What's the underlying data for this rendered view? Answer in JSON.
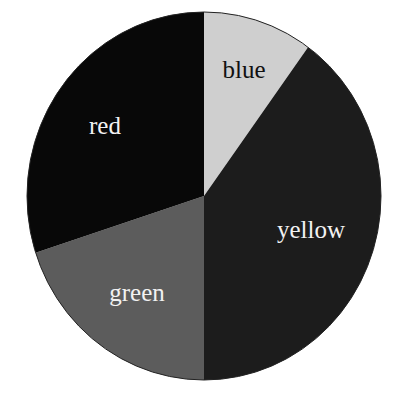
{
  "chart_data": {
    "type": "pie",
    "title": "",
    "categories": [
      "blue",
      "yellow",
      "green",
      "red"
    ],
    "values": [
      10,
      40,
      20,
      30
    ],
    "units": "percent (estimated from slice angles)",
    "start_angle_deg": 0,
    "direction": "clockwise from 12 o'clock",
    "legend": "none (labels drawn inside slices)",
    "slices": [
      {
        "label": "blue",
        "value": 10,
        "fill": "#cfcfcf",
        "text_color": "#111111",
        "label_pos": [
          244,
          72
        ]
      },
      {
        "label": "yellow",
        "value": 40,
        "fill": "#1c1c1c",
        "text_color": "#f2f2f2",
        "label_pos": [
          311,
          232
        ]
      },
      {
        "label": "green",
        "value": 20,
        "fill": "#5c5c5c",
        "text_color": "#f2f2f2",
        "label_pos": [
          137,
          295
        ]
      },
      {
        "label": "red",
        "value": 30,
        "fill": "#080808",
        "text_color": "#f2f2f2",
        "label_pos": [
          105,
          128
        ]
      }
    ],
    "geometry": {
      "cx": 204,
      "cy": 196,
      "rx": 177,
      "ry": 184
    }
  }
}
